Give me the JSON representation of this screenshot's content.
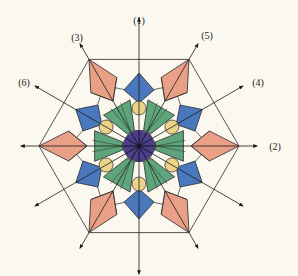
{
  "diagram": {
    "type": "hexagonal symmetry pattern with labelled axes",
    "center": [
      139,
      146
    ],
    "colors": {
      "background": "#fbf8f0",
      "line": "#2a2a2a",
      "blue_diamond": "#4a78bd",
      "salmon_kite": "#e9a086",
      "green_wedge": "#5fa57c",
      "yellow_circle": "#ecd38a",
      "purple_center": "#4b3f8c"
    },
    "axes": [
      {
        "label": "(1)",
        "angle_deg": 90
      },
      {
        "label": "(2)",
        "angle_deg": 0
      },
      {
        "label": "(3)",
        "angle_deg": 120
      },
      {
        "label": "(4)",
        "angle_deg": 30
      },
      {
        "label": "(5)",
        "angle_deg": 60
      },
      {
        "label": "(6)",
        "angle_deg": 150
      }
    ],
    "unlabelled_axis_ends": [
      180,
      210,
      240,
      270,
      300,
      330
    ]
  }
}
